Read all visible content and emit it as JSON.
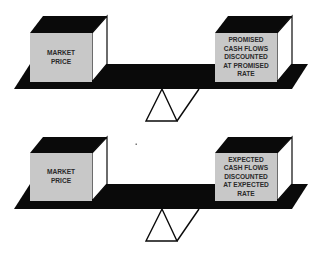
{
  "colors": {
    "background": "#ffffff",
    "plank": "#0a0a0a",
    "box_front": "#c8c8c8",
    "box_top": "#0a0a0a",
    "box_side": "#ffffff",
    "text": "#2a2a2a"
  },
  "scales": [
    {
      "left_box": {
        "lines": [
          "MARKET",
          "PRICE"
        ]
      },
      "right_box": {
        "lines": [
          "PROMISED",
          "CASH FLOWS",
          "DISCOUNTED",
          "AT PROMISED",
          "RATE"
        ]
      }
    },
    {
      "left_box": {
        "lines": [
          "MARKET",
          "PRICE"
        ]
      },
      "right_box": {
        "lines": [
          "EXPECTED",
          "CASH FLOWS",
          "DISCOUNTED",
          "AT EXPECTED",
          "RATE"
        ]
      }
    }
  ]
}
